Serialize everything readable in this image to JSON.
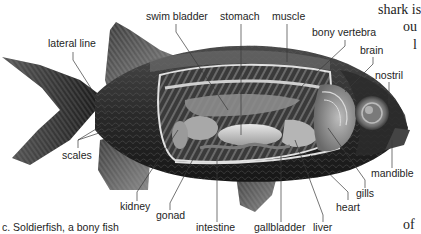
{
  "figure": {
    "caption": "c. Soldierfish, a bony fish"
  },
  "labels": {
    "lateral_line": "lateral line",
    "swim_bladder": "swim bladder",
    "stomach": "stomach",
    "muscle": "muscle",
    "bony_vertebra": "bony vertebra",
    "brain": "brain",
    "nostril": "nostril",
    "mandible": "mandible",
    "gills": "gills",
    "heart": "heart",
    "liver": "liver",
    "gallbladder": "gallbladder",
    "intestine": "intestine",
    "gonad": "gonad",
    "kidney": "kidney",
    "scales": "scales"
  },
  "page_text_fragments": {
    "line1": "shark is",
    "line2": "ou",
    "line3": "l",
    "line4": "of"
  },
  "colors": {
    "background": "#ffffff",
    "label_text": "#1e1e1e",
    "leader_line": "#3a3a3a",
    "fish_dark": "#1c1c1c",
    "fish_mid": "#5a5a5a",
    "fish_light": "#b8b8b8",
    "organ_light": "#d8d8d8",
    "cavity_line": "#e6e6e6"
  }
}
